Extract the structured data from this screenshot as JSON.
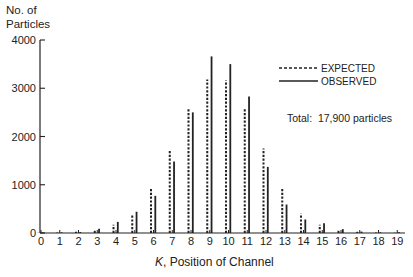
{
  "chart_data": {
    "type": "bar",
    "title": "",
    "ylabel": "No. of Particles",
    "ylabel_lines": [
      "No. of",
      "Particles"
    ],
    "xlabel_italic": "K",
    "xlabel_rest": ", Position of Channel",
    "xlabel": "K, Position of Channel",
    "ylim": [
      0,
      4000
    ],
    "yticks": [
      0,
      1000,
      2000,
      3000,
      4000
    ],
    "categories": [
      0,
      1,
      2,
      3,
      4,
      5,
      6,
      7,
      8,
      9,
      10,
      11,
      12,
      13,
      14,
      15,
      16,
      17,
      18,
      19
    ],
    "series": [
      {
        "name": "EXPECTED",
        "style": "dashed",
        "values": [
          5,
          10,
          25,
          70,
          170,
          380,
          920,
          1700,
          2600,
          3180,
          3160,
          2600,
          1750,
          940,
          400,
          170,
          70,
          25,
          10,
          5
        ]
      },
      {
        "name": "OBSERVED",
        "style": "solid",
        "values": [
          10,
          15,
          20,
          90,
          230,
          440,
          770,
          1480,
          2500,
          3660,
          3500,
          2830,
          1370,
          590,
          280,
          200,
          80,
          30,
          15,
          15
        ]
      }
    ],
    "legend": {
      "position": "upper-right",
      "entries": [
        "EXPECTED",
        "OBSERVED"
      ]
    },
    "annotation": "Total:  17,900 particles",
    "grid": false
  }
}
